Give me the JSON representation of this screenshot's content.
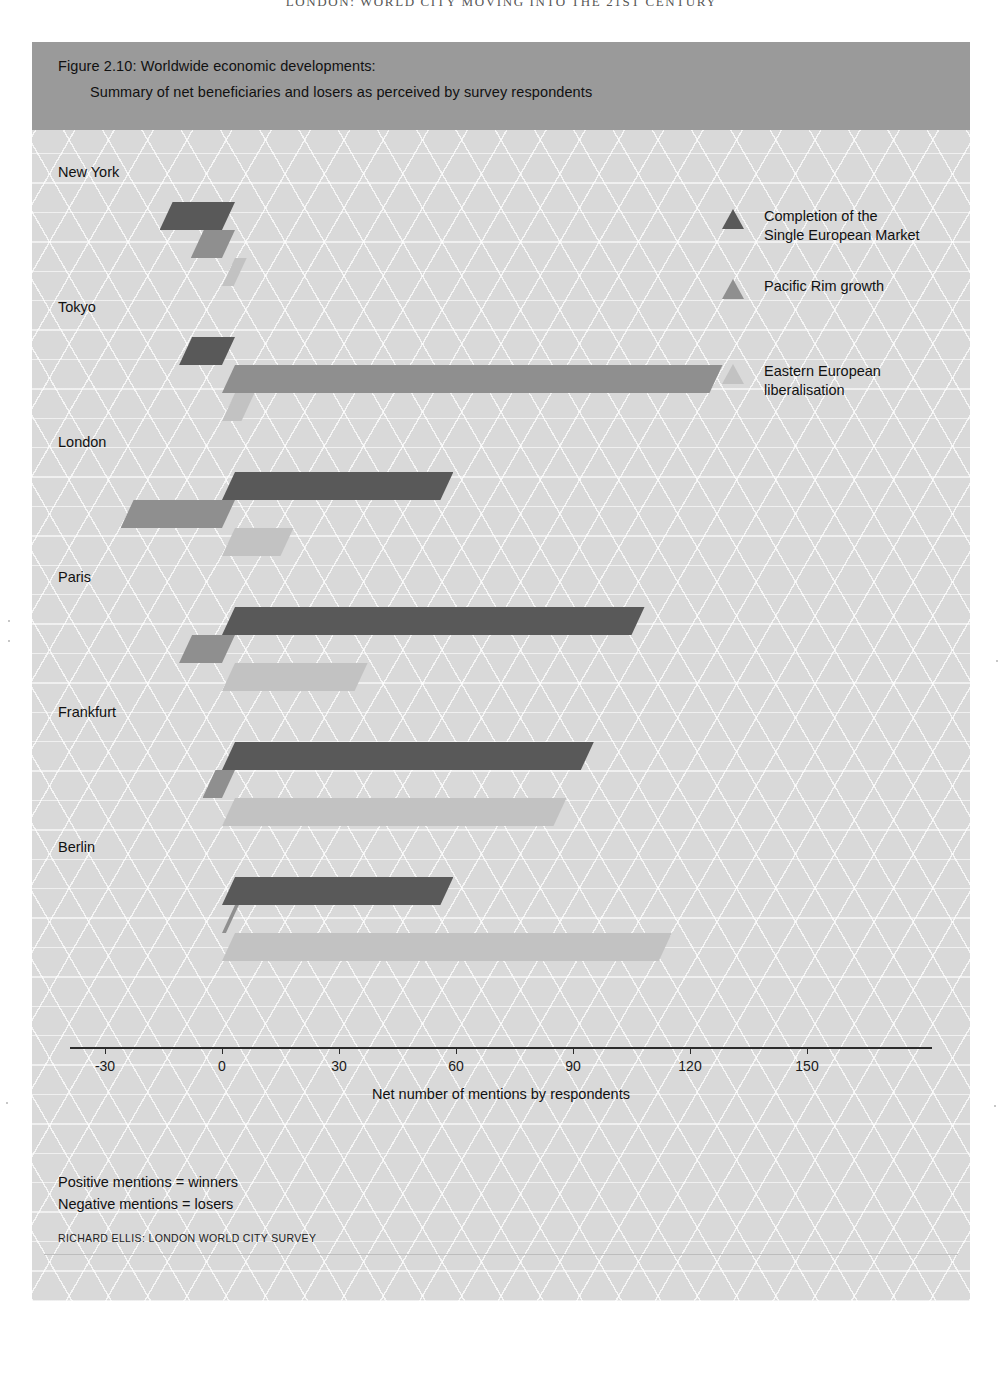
{
  "running_header": "LONDON: WORLD CITY MOVING INTO THE 21ST CENTURY",
  "figure": {
    "title_line1": "Figure 2.10: Worldwide economic developments:",
    "title_line2": "Summary of net beneficiaries and losers as perceived by survey respondents",
    "source": "RICHARD ELLIS: LONDON WORLD CITY SURVEY",
    "notes": [
      "Positive mentions =  winners",
      "Negative mentions =  losers"
    ]
  },
  "colors": {
    "panel_background": "#d9d9d9",
    "title_band": "#9a9a9a",
    "series_dark": "#595959",
    "series_medium": "#8f8f8f",
    "series_light": "#c2c2c2",
    "axis": "#2b2b2b"
  },
  "chart_data": {
    "type": "bar",
    "orientation": "horizontal",
    "title": "Figure 2.10: Worldwide economic developments: Summary of net beneficiaries and losers as perceived by survey respondents",
    "xlabel": "Net number of mentions by respondents",
    "ylabel": "",
    "xlim": [
      -40,
      165
    ],
    "xticks": [
      -30,
      0,
      30,
      60,
      90,
      120,
      150
    ],
    "xtick_labels": [
      "-30",
      "0",
      "30",
      "60",
      "90",
      "120",
      "150"
    ],
    "grid": false,
    "legend_position": "top-right",
    "categories": [
      "New York",
      "Tokyo",
      "London",
      "Paris",
      "Frankfurt",
      "Berlin"
    ],
    "series": [
      {
        "name": "Completion of the Single European Market",
        "color": "#595959",
        "values": [
          -16,
          -11,
          56,
          105,
          92,
          56
        ]
      },
      {
        "name": "Pacific Rim growth",
        "color": "#8f8f8f",
        "values": [
          -8,
          125,
          -26,
          -11,
          -5,
          1
        ]
      },
      {
        "name": "Eastern European liberalisation",
        "color": "#c2c2c2",
        "values": [
          3,
          5,
          15,
          34,
          85,
          112
        ]
      }
    ]
  },
  "legend": {
    "items": [
      {
        "marker": "triangle-up-icon",
        "label_line1": "Completion of the",
        "label_line2": "Single European Market"
      },
      {
        "marker": "triangle-up-icon",
        "label_line1": "Pacific Rim growth",
        "label_line2": ""
      },
      {
        "marker": "triangle-up-icon",
        "label_line1": "Eastern European",
        "label_line2": "liberalisation"
      }
    ]
  }
}
